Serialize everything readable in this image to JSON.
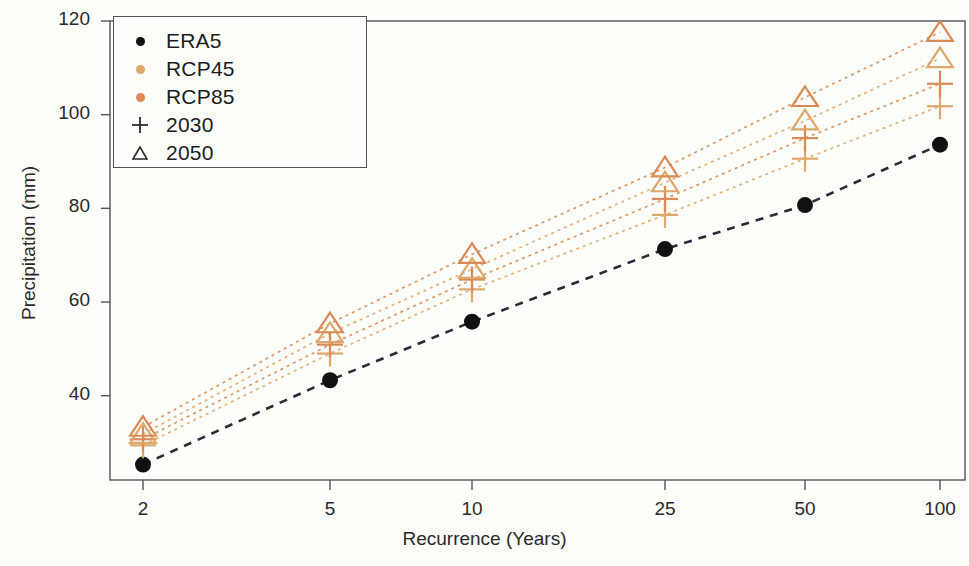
{
  "chart_data": {
    "type": "scatter",
    "title": "",
    "subtitle": "",
    "xlabel": "Recurrence (Years)",
    "ylabel": "Precipitation (mm)",
    "categories": [
      "2",
      "5",
      "10",
      "25",
      "50",
      "100"
    ],
    "x_tick_labels": [
      "2",
      "5",
      "10",
      "25",
      "50",
      "100"
    ],
    "y_tick_labels": [
      "40",
      "60",
      "80",
      "100",
      "120"
    ],
    "y_ticks": [
      40,
      60,
      80,
      100,
      120
    ],
    "ylim": [
      22,
      120
    ],
    "grid": false,
    "legend_position": "top-left",
    "legend_entries": [
      {
        "label": "ERA5",
        "marker": "dot",
        "color": "#111111"
      },
      {
        "label": "RCP45",
        "marker": "dot",
        "color": "#dca86b"
      },
      {
        "label": "RCP85",
        "marker": "dot",
        "color": "#d98a57"
      },
      {
        "label": "2030",
        "marker": "plus",
        "color": "#2a2a2a"
      },
      {
        "label": "2050",
        "marker": "triangle",
        "color": "#2a2a2a"
      }
    ],
    "series": [
      {
        "name": "ERA5",
        "marker": "dot",
        "color": "#111111",
        "line_color": "#2b2b38",
        "values": [
          25.3,
          43.3,
          55.8,
          71.3,
          80.7,
          93.6
        ]
      },
      {
        "name": "RCP45 2030",
        "marker": "plus",
        "color": "#dca86b",
        "line_color": "#e0b57c",
        "values": [
          29.4,
          49.0,
          62.7,
          78.6,
          90.6,
          101.8
        ]
      },
      {
        "name": "RCP85 2030",
        "marker": "plus",
        "color": "#d98a57",
        "line_color": "#dd9a67",
        "values": [
          30.7,
          50.9,
          64.8,
          82.0,
          95.0,
          106.6
        ]
      },
      {
        "name": "RCP45 2050",
        "marker": "triangle",
        "color": "#dca86b",
        "line_color": "#e0b57c",
        "values": [
          31.8,
          53.3,
          67.0,
          85.5,
          98.7,
          112.0
        ]
      },
      {
        "name": "RCP85 2050",
        "marker": "triangle",
        "color": "#d98a57",
        "line_color": "#dd9a67",
        "values": [
          33.3,
          55.4,
          70.2,
          88.7,
          103.7,
          117.6
        ]
      }
    ],
    "colors": {
      "era5": "#111111",
      "rcp45": "#dca86b",
      "rcp85": "#d98a57",
      "axis": "#555555",
      "background": "#fdfdfa"
    }
  }
}
